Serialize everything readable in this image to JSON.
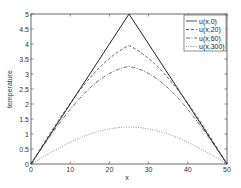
{
  "chart_data": {
    "type": "line",
    "title": "",
    "xlabel": "x",
    "ylabel": "temperature",
    "xlim": [
      0,
      50
    ],
    "ylim": [
      0,
      5
    ],
    "grid": false,
    "legend_position": "upper right",
    "x_ticks": [
      "0",
      "10",
      "20",
      "30",
      "40",
      "50"
    ],
    "y_ticks": [
      "0",
      "0.5",
      "1",
      "1.5",
      "2",
      "2.5",
      "3",
      "3.5",
      "4",
      "4.5",
      "5"
    ],
    "x": [
      0,
      5,
      10,
      15,
      20,
      25,
      30,
      35,
      40,
      45,
      50
    ],
    "series": [
      {
        "name": "u(x,0)",
        "style": "solid",
        "values": [
          0,
          1.0,
          2.0,
          3.0,
          4.0,
          5.0,
          4.0,
          3.0,
          2.0,
          1.0,
          0
        ]
      },
      {
        "name": "u(x,20)",
        "style": "dashed",
        "values": [
          0,
          0.98,
          1.9,
          2.75,
          3.45,
          3.95,
          3.45,
          2.75,
          1.9,
          0.98,
          0
        ]
      },
      {
        "name": "u(x,60)",
        "style": "dashdot",
        "values": [
          0,
          0.95,
          1.75,
          2.4,
          2.95,
          3.25,
          2.95,
          2.4,
          1.75,
          0.95,
          0
        ]
      },
      {
        "name": "u(x,300)",
        "style": "dotted",
        "values": [
          0,
          0.38,
          0.72,
          0.99,
          1.17,
          1.23,
          1.17,
          0.99,
          0.72,
          0.38,
          0
        ]
      }
    ]
  }
}
